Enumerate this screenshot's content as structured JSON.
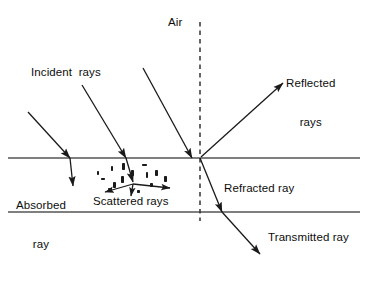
{
  "diagram": {
    "canvas": {
      "width": 367,
      "height": 290,
      "background": "#ffffff"
    },
    "colors": {
      "stroke": "#1a1a1a",
      "boundary": "#555555",
      "normal": "#333333",
      "text": "#0d0d0d"
    },
    "labels": {
      "air": "Air",
      "incident": "Incident  rays",
      "reflected_line1": "Reflected",
      "reflected_line2": "rays",
      "absorbed_line1": "Absorbed",
      "absorbed_line2": "ray",
      "scattered": "Scattered rays",
      "refracted": "Refracted ray",
      "transmitted": "Transmitted ray"
    },
    "boundaries": [
      {
        "name": "upper-surface",
        "y": 158,
        "x1": 8,
        "x2": 360
      },
      {
        "name": "lower-surface",
        "y": 212,
        "x1": 8,
        "x2": 360
      }
    ],
    "normal_line": {
      "x": 200,
      "y1": 22,
      "y2": 221,
      "style": "dashed"
    },
    "rays": {
      "incident": [
        {
          "x1": 28,
          "y1": 112,
          "x2": 70,
          "y2": 158
        },
        {
          "x1": 82,
          "y1": 85,
          "x2": 126,
          "y2": 158
        },
        {
          "x1": 143,
          "y1": 68,
          "x2": 192,
          "y2": 158
        }
      ],
      "reflected": {
        "x1": 201,
        "y1": 157,
        "x2": 283,
        "y2": 83
      },
      "absorbed": {
        "x1": 70,
        "y1": 158,
        "x2": 73,
        "y2": 186
      },
      "through_to_scatter": {
        "x1": 126,
        "y1": 158,
        "x2": 133,
        "y2": 182
      },
      "refracted": {
        "x1": 200,
        "y1": 158,
        "x2": 222,
        "y2": 212
      },
      "transmitted": {
        "x1": 222,
        "y1": 212,
        "x2": 260,
        "y2": 254
      },
      "scattered": [
        {
          "x1": 133,
          "y1": 184,
          "x2": 105,
          "y2": 192
        },
        {
          "x1": 133,
          "y1": 184,
          "x2": 170,
          "y2": 188
        },
        {
          "x1": 133,
          "y1": 184,
          "x2": 131,
          "y2": 196
        }
      ]
    },
    "particles": [
      {
        "x": 101,
        "y": 178,
        "w": 4,
        "h": 2,
        "r": 0
      },
      {
        "x": 111,
        "y": 166,
        "w": 2,
        "h": 5,
        "r": 0
      },
      {
        "x": 113,
        "y": 182,
        "w": 3,
        "h": 6,
        "r": 0
      },
      {
        "x": 122,
        "y": 163,
        "w": 3,
        "h": 7,
        "r": 0
      },
      {
        "x": 121,
        "y": 176,
        "w": 3,
        "h": 7,
        "r": 0
      },
      {
        "x": 131,
        "y": 170,
        "w": 3,
        "h": 6,
        "r": 0
      },
      {
        "x": 142,
        "y": 164,
        "w": 5,
        "h": 2,
        "r": 0
      },
      {
        "x": 146,
        "y": 172,
        "w": 2,
        "h": 6,
        "r": 0
      },
      {
        "x": 155,
        "y": 170,
        "w": 3,
        "h": 6,
        "r": 0
      },
      {
        "x": 164,
        "y": 176,
        "w": 3,
        "h": 6,
        "r": 0
      },
      {
        "x": 108,
        "y": 188,
        "w": 4,
        "h": 2,
        "r": 0
      },
      {
        "x": 137,
        "y": 190,
        "w": 3,
        "h": 3,
        "r": 0
      },
      {
        "x": 150,
        "y": 183,
        "w": 3,
        "h": 4,
        "r": 0
      },
      {
        "x": 97,
        "y": 171,
        "w": 2,
        "h": 4,
        "r": 0
      }
    ]
  }
}
